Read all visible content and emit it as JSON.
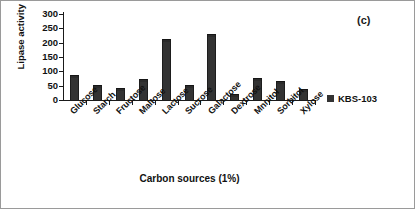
{
  "figure": {
    "panel_label": "(c)",
    "background_color": "#ffffff",
    "border_color": "#9a9a9a"
  },
  "legend": {
    "position": "right",
    "entries": [
      {
        "label": "KBS-103",
        "color": "#333333",
        "marker": "square-swatch"
      }
    ]
  },
  "chart_data": {
    "type": "bar",
    "title": "",
    "subtitle": "",
    "xlabel": "Carbon sources (1%)",
    "ylabel": "Lipase activity (U/ml)",
    "categories": [
      "Glucose",
      "Starch",
      "Fructose",
      "Maltose",
      "Lactose",
      "Sucrose",
      "Galactose",
      "Dextrose",
      "Mnnitol",
      "Sorbitol",
      "Xylose"
    ],
    "series": [
      {
        "name": "KBS-103",
        "color": "#333333",
        "values": [
          88,
          53,
          42,
          75,
          213,
          53,
          230,
          20,
          78,
          68,
          40
        ]
      }
    ],
    "values": [
      88,
      53,
      42,
      75,
      213,
      53,
      230,
      20,
      78,
      68,
      40
    ],
    "ylim": [
      0,
      300
    ],
    "yticks": [
      0,
      50,
      100,
      150,
      200,
      250,
      300
    ],
    "ytick_labels": [
      "0",
      "50",
      "100",
      "150",
      "200",
      "250",
      "300"
    ],
    "grid": false,
    "annotations": [
      "(c)"
    ],
    "bar_color": "#333333",
    "units": "U/ml"
  }
}
